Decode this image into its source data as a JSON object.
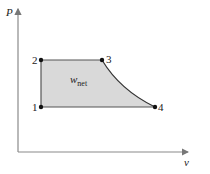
{
  "diagram": {
    "type": "P-v diagram",
    "axes": {
      "y_label": "P",
      "x_label": "v"
    },
    "points": [
      {
        "id": "1",
        "label": "1"
      },
      {
        "id": "2",
        "label": "2"
      },
      {
        "id": "3",
        "label": "3"
      },
      {
        "id": "4",
        "label": "4"
      }
    ],
    "area_label": {
      "main": "w",
      "subscript": "net"
    },
    "colors": {
      "area_fill": "#d9d9d9",
      "cycle_stroke": "#333333",
      "axis_stroke": "#888888",
      "point": "#111111"
    }
  }
}
